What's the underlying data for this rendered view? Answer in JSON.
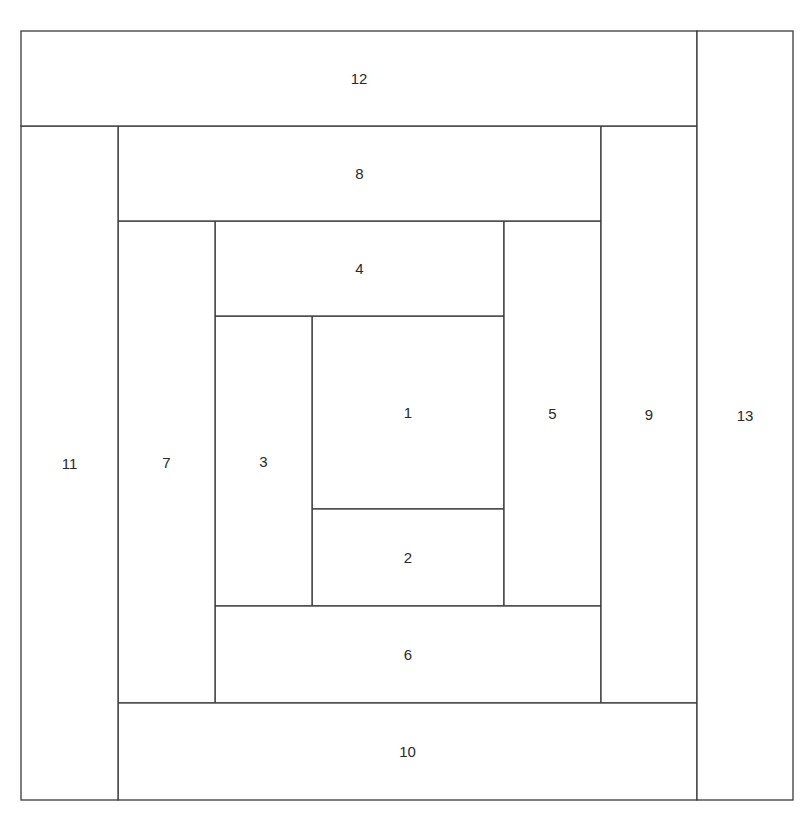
{
  "diagram": {
    "line_color": "#3a3a3a",
    "label_color": "#2a2a2a",
    "background": "#ffffff",
    "pieces": [
      {
        "id": "piece-1",
        "label": "1"
      },
      {
        "id": "piece-2",
        "label": "2"
      },
      {
        "id": "piece-3",
        "label": "3"
      },
      {
        "id": "piece-4",
        "label": "4"
      },
      {
        "id": "piece-5",
        "label": "5"
      },
      {
        "id": "piece-6",
        "label": "6"
      },
      {
        "id": "piece-7",
        "label": "7"
      },
      {
        "id": "piece-8",
        "label": "8"
      },
      {
        "id": "piece-9",
        "label": "9"
      },
      {
        "id": "piece-10",
        "label": "10"
      },
      {
        "id": "piece-11",
        "label": "11"
      },
      {
        "id": "piece-12",
        "label": "12"
      },
      {
        "id": "piece-13",
        "label": "13"
      }
    ]
  }
}
